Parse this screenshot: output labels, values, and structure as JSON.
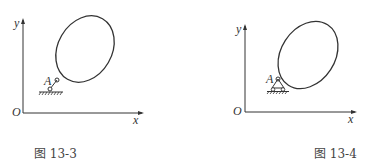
{
  "figures": [
    {
      "id": "fig-13-3",
      "caption": "图 13-3",
      "labels": {
        "y": "y",
        "x": "x",
        "origin": "O",
        "point": "A"
      },
      "support": "fixed-pin"
    },
    {
      "id": "fig-13-4",
      "caption": "图 13-4",
      "labels": {
        "y": "y",
        "x": "x",
        "origin": "O",
        "point": "A"
      },
      "support": "roller"
    }
  ],
  "colors": {
    "line": "#333333",
    "background": "#ffffff"
  }
}
